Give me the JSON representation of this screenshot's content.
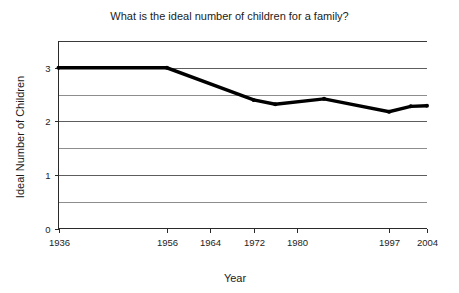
{
  "chart_data": {
    "type": "line",
    "title": "What is the ideal number of children for a family?",
    "xlabel": "Year",
    "ylabel": "Ideal Number of Children",
    "grid": true,
    "legend": "none",
    "xlim": [
      1936,
      2004
    ],
    "ylim": [
      0,
      3.5
    ],
    "yticks": [
      0,
      1,
      2,
      3
    ],
    "ytick_labels": [
      "0",
      "1",
      "2",
      "3"
    ],
    "y_minor_gridlines": [
      0.5,
      1.5,
      2.5,
      3.5
    ],
    "xticks": [
      1936,
      1956,
      1964,
      1972,
      1980,
      1997,
      2004
    ],
    "xtick_labels": [
      "1936",
      "1956",
      "1964",
      "1972",
      "1980",
      "1997",
      "2004"
    ],
    "series": [
      {
        "name": "Ideal number of children",
        "x": [
          1936,
          1956,
          1972,
          1976,
          1985,
          1997,
          2001,
          2004
        ],
        "values": [
          3.0,
          3.0,
          2.4,
          2.32,
          2.42,
          2.18,
          2.28,
          2.29
        ]
      }
    ]
  },
  "chart_meta": {
    "line_color": "#000000",
    "grid_color": "#8d8d8d",
    "axis_color": "#2a2a2a",
    "background_color": "#ffffff"
  }
}
